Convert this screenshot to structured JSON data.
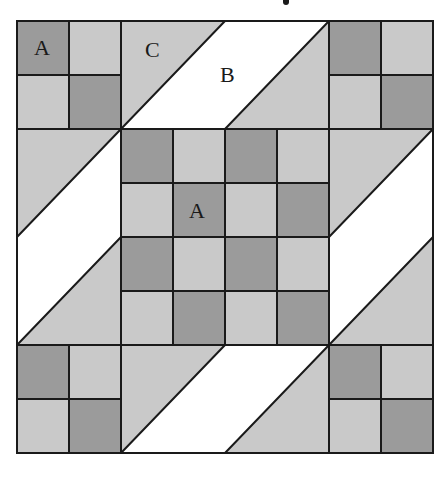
{
  "diagram": {
    "type": "quilt-block",
    "grid": {
      "x0": 17,
      "y0": 21,
      "cell_w": 52,
      "cell_h": 54,
      "cols": 8,
      "rows": 8
    },
    "colors": {
      "light": "#c9c9c9",
      "dark": "#9b9b9b",
      "white": "#ffffff",
      "line": "#1a1a1a"
    },
    "corner_four_patches": [
      {
        "id": "top-left",
        "col": 0,
        "row": 0,
        "cells": [
          "dark",
          "light",
          "light",
          "dark"
        ]
      },
      {
        "id": "top-right",
        "col": 6,
        "row": 0,
        "cells": [
          "dark",
          "light",
          "light",
          "dark"
        ]
      },
      {
        "id": "bottom-left",
        "col": 0,
        "row": 6,
        "cells": [
          "dark",
          "light",
          "light",
          "dark"
        ]
      },
      {
        "id": "bottom-right",
        "col": 6,
        "row": 6,
        "cells": [
          "dark",
          "light",
          "light",
          "dark"
        ]
      }
    ],
    "center_checkerboard": {
      "col": 2,
      "row": 2,
      "size": 4,
      "cells": [
        [
          "dark",
          "light",
          "dark",
          "light"
        ],
        [
          "light",
          "dark",
          "light",
          "dark"
        ],
        [
          "dark",
          "light",
          "dark",
          "light"
        ],
        [
          "light",
          "dark",
          "light",
          "dark"
        ]
      ]
    },
    "labels": [
      {
        "text": "A",
        "x": 34,
        "y": 55
      },
      {
        "text": "C",
        "x": 145,
        "y": 57
      },
      {
        "text": "B",
        "x": 220,
        "y": 82
      },
      {
        "text": "A",
        "x": 189,
        "y": 218
      }
    ]
  }
}
